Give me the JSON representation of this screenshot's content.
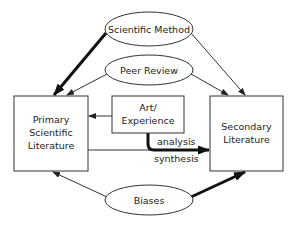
{
  "diagram": {
    "nodes": {
      "scientific_method": {
        "label": "Scientific Method",
        "shape": "ellipse"
      },
      "peer_review": {
        "label": "Peer Review",
        "shape": "ellipse"
      },
      "biases": {
        "label": "Biases",
        "shape": "ellipse"
      },
      "primary": {
        "line1": "Primary",
        "line2": "Scientific",
        "line3": "Literature",
        "shape": "box"
      },
      "art": {
        "line1": "Art/",
        "line2": "Experience",
        "shape": "box"
      },
      "secondary": {
        "line1": "Secondary",
        "line2": "Literature",
        "shape": "box"
      }
    },
    "edge_labels": {
      "analysis": "analysis",
      "synthesis": "synthesis"
    },
    "edges": [
      {
        "from": "Scientific Method",
        "to": "Primary Scientific Literature",
        "weight": "thick"
      },
      {
        "from": "Scientific Method",
        "to": "Secondary Literature",
        "weight": "thin"
      },
      {
        "from": "Peer Review",
        "to": "Primary Scientific Literature",
        "weight": "thin"
      },
      {
        "from": "Peer Review",
        "to": "Secondary Literature",
        "weight": "thin"
      },
      {
        "from": "Art/Experience",
        "to": "Primary Scientific Literature",
        "weight": "thin"
      },
      {
        "from": "Art/Experience",
        "to": "Secondary Literature",
        "weight": "thick"
      },
      {
        "from": "Primary Scientific Literature",
        "to": "Secondary Literature",
        "weight": "thick",
        "label": "analysis / synthesis"
      },
      {
        "from": "Biases",
        "to": "Primary Scientific Literature",
        "weight": "thin"
      },
      {
        "from": "Biases",
        "to": "Secondary Literature",
        "weight": "thick"
      }
    ],
    "colors": {
      "stroke": "#333333",
      "background": "#ffffff"
    }
  }
}
